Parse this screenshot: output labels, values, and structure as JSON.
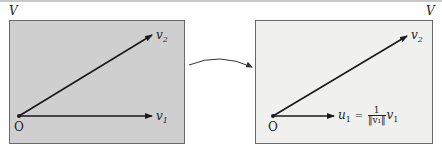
{
  "left_panel": {
    "space_label": "V",
    "origin_label": "O",
    "vectors": [
      {
        "name": "v2",
        "label": "v",
        "subscript": "2",
        "arrow": "⃗"
      },
      {
        "name": "v1",
        "label": "v",
        "subscript": "1",
        "arrow": "⃗"
      }
    ],
    "fill": "#cfcfcf"
  },
  "right_panel": {
    "space_label": "V",
    "origin_label": "O",
    "vectors": [
      {
        "name": "v2",
        "label": "v",
        "subscript": "2",
        "arrow": "⃗"
      },
      {
        "name": "u1",
        "label": "u",
        "subscript": "1",
        "arrow": "⃗"
      }
    ],
    "u1_formula": {
      "lhs": "u",
      "lhs_sub": "1",
      "equals": "=",
      "numerator": "1",
      "denominator": "‖v₁‖",
      "rhs": "v",
      "rhs_sub": "1"
    },
    "fill": "#f0f0ef"
  },
  "transition_arrow": {
    "description": "curved arrow from left panel to right panel"
  }
}
